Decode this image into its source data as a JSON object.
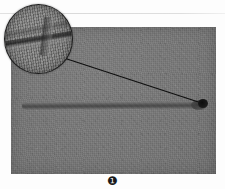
{
  "figure": {
    "domain": "scientific-photograph",
    "caption_label": "❶",
    "caption_number": "2",
    "background_color": "#ffffff",
    "rule": {
      "name": "top-divider",
      "color": "#dedede"
    },
    "photo": {
      "name": "specimen-photograph",
      "description": "grayscale photograph of an elongated rod-like specimen on a textured fabric backing",
      "background_color": "#757575",
      "border_color": "#6a6a6a",
      "specimen": {
        "name": "elongated-rod-specimen",
        "color": "#565656",
        "orientation": "horizontal"
      },
      "marker": {
        "name": "point-of-interest-marker",
        "color": "#141414",
        "shape": "dot"
      },
      "leader_line": {
        "name": "magnifier-leader-line",
        "color": "#101010",
        "from": "magnified-inset",
        "to": "point-of-interest-marker"
      }
    },
    "magnifier": {
      "name": "magnified-detail-inset",
      "description": "circular magnified close-up of the specimen surface showing a linear groove feature",
      "border_color": "#1c1c1c",
      "shape": "circle"
    }
  }
}
